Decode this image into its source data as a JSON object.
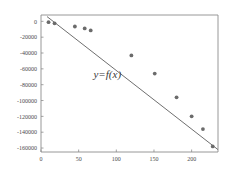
{
  "chart_data": {
    "type": "scatter",
    "title": "",
    "subtitle": "",
    "xlabel": "",
    "ylabel": "",
    "xlim": [
      0,
      235
    ],
    "ylim": [
      -165000,
      8000
    ],
    "grid": false,
    "legend": null,
    "annotations": [
      {
        "text": "y=f(x)",
        "x": 88,
        "y": -72000
      }
    ],
    "xticks": [
      0,
      50,
      100,
      150,
      200
    ],
    "xtick_labels": [
      "0",
      "50",
      "100",
      "150",
      "200"
    ],
    "yticks": [
      0,
      -20000,
      -40000,
      -60000,
      -80000,
      -100000,
      -120000,
      -140000,
      -160000
    ],
    "ytick_labels": [
      "0",
      "-20000",
      "-40000",
      "-60000",
      "-80000",
      "-100000",
      "-120000",
      "-140000",
      "-160000"
    ],
    "series": [
      {
        "name": "observations",
        "marker": "circle",
        "color": "#6b6b6b",
        "x": [
          10,
          18,
          45,
          58,
          66,
          120,
          151,
          180,
          200,
          215,
          228
        ],
        "y": [
          -1000,
          -2500,
          -6500,
          -9000,
          -11500,
          -43000,
          -66000,
          -96000,
          -120000,
          -136000,
          -158000
        ]
      },
      {
        "name": "fitted-line",
        "type": "line",
        "color": "#6f6f6f",
        "x": [
          8,
          235
        ],
        "y": [
          6000,
          -162000
        ]
      }
    ]
  }
}
